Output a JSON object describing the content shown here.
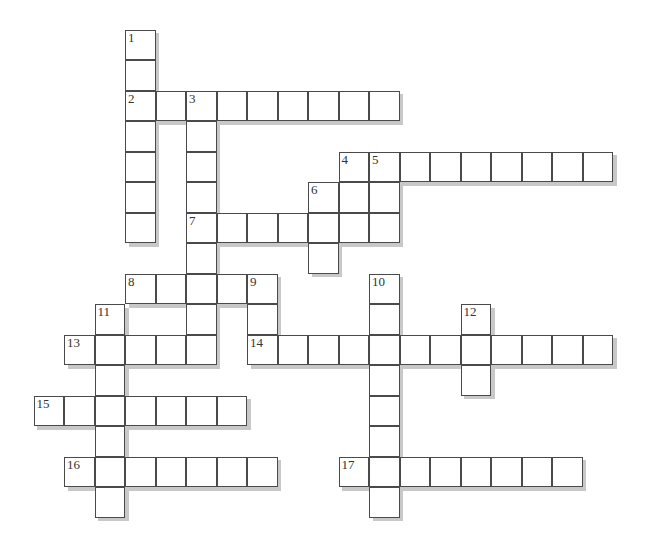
{
  "puzzle": {
    "type": "crossword",
    "cell_size": 30.5,
    "origin": {
      "x": 34,
      "y": 30
    },
    "line_color": "#4a4a4a",
    "shadow_color": "#c8c8c8",
    "numbers": [
      "1",
      "2",
      "3",
      "4",
      "5",
      "6",
      "7",
      "8",
      "9",
      "10",
      "11",
      "12",
      "13",
      "14",
      "15",
      "16",
      "17"
    ],
    "entries": [
      {
        "number": "1",
        "direction": "down",
        "col": 3,
        "row": 0,
        "length": 7
      },
      {
        "number": "2",
        "direction": "across",
        "col": 3,
        "row": 2,
        "length": 9
      },
      {
        "number": "3",
        "direction": "down",
        "col": 5,
        "row": 2,
        "length": 9
      },
      {
        "number": "4",
        "direction": "across",
        "col": 10,
        "row": 4,
        "length": 9
      },
      {
        "number": "4",
        "direction": "down",
        "col": 10,
        "row": 4,
        "length": 3
      },
      {
        "number": "5",
        "direction": "down",
        "col": 11,
        "row": 4,
        "length": 3
      },
      {
        "number": "6",
        "direction": "down",
        "col": 9,
        "row": 5,
        "length": 3
      },
      {
        "number": "7",
        "direction": "across",
        "col": 5,
        "row": 6,
        "length": 7
      },
      {
        "number": "8",
        "direction": "across",
        "col": 3,
        "row": 8,
        "length": 5
      },
      {
        "number": "9",
        "direction": "down",
        "col": 7,
        "row": 8,
        "length": 3
      },
      {
        "number": "10",
        "direction": "down",
        "col": 11,
        "row": 8,
        "length": 8
      },
      {
        "number": "11",
        "direction": "down",
        "col": 2,
        "row": 9,
        "length": 7
      },
      {
        "number": "12",
        "direction": "down",
        "col": 14,
        "row": 9,
        "length": 3
      },
      {
        "number": "13",
        "direction": "across",
        "col": 1,
        "row": 10,
        "length": 5
      },
      {
        "number": "14",
        "direction": "across",
        "col": 7,
        "row": 10,
        "length": 12
      },
      {
        "number": "15",
        "direction": "across",
        "col": 0,
        "row": 12,
        "length": 7
      },
      {
        "number": "16",
        "direction": "across",
        "col": 1,
        "row": 14,
        "length": 7
      },
      {
        "number": "17",
        "direction": "across",
        "col": 10,
        "row": 14,
        "length": 8
      }
    ]
  }
}
